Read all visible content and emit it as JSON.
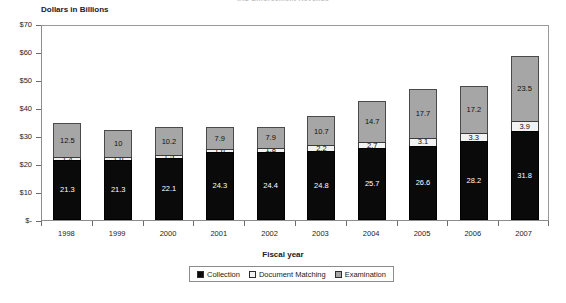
{
  "chart_data": {
    "type": "bar",
    "subtype": "stacked-column",
    "title": "IRS Enforcement Revenue",
    "xlabel": "Fiscal year",
    "ylabel": "Dollars in Billions",
    "categories": [
      "1998",
      "1999",
      "2000",
      "2001",
      "2002",
      "2003",
      "2004",
      "2005",
      "2006",
      "2007"
    ],
    "series": [
      {
        "name": "Collection",
        "color": "#0a0a0a",
        "values": [
          21.3,
          21.3,
          22.1,
          24.3,
          24.4,
          24.8,
          25.7,
          26.6,
          28.2,
          31.8
        ],
        "labels": [
          "21.3",
          "21.3",
          "22.1",
          "24.3",
          "24.4",
          "24.8",
          "25.7",
          "26.6",
          "28.2",
          "31.8"
        ]
      },
      {
        "name": "Document Matching",
        "color": "#f2f2f2",
        "values": [
          1.4,
          1.6,
          1.5,
          1.6,
          1.8,
          2.2,
          2.7,
          3.1,
          3.3,
          3.9
        ],
        "labels": [
          "1.4",
          "1.6",
          "1.5",
          "1.6",
          "1.8",
          "2.2",
          "2.7",
          "3.1",
          "3.3",
          "3.9"
        ]
      },
      {
        "name": "Examination",
        "color": "#a6a6a6",
        "values": [
          12.5,
          10.0,
          10.2,
          7.9,
          7.9,
          10.7,
          14.7,
          17.7,
          17.2,
          23.5
        ],
        "labels": [
          "12.5",
          "10",
          "10.2",
          "7.9",
          "7.9",
          "10.7",
          "14.7",
          "17.7",
          "17.2",
          "23.5"
        ]
      }
    ],
    "totals": [
      35.2,
      32.9,
      33.8,
      33.8,
      34.1,
      37.7,
      43.1,
      47.4,
      48.7,
      59.2
    ],
    "ylim": [
      0,
      70
    ],
    "yticks": [
      0,
      10,
      20,
      30,
      40,
      50,
      60,
      70
    ],
    "ytick_labels": [
      "$-",
      "$10",
      "$20",
      "$30",
      "$40",
      "$50",
      "$60",
      "$70"
    ],
    "grid": false,
    "legend_position": "bottom",
    "legend": [
      {
        "label": "Collection",
        "color": "#0a0a0a"
      },
      {
        "label": "Document Matching",
        "color": "#f2f2f2"
      },
      {
        "label": "Examination",
        "color": "#a6a6a6"
      }
    ]
  }
}
